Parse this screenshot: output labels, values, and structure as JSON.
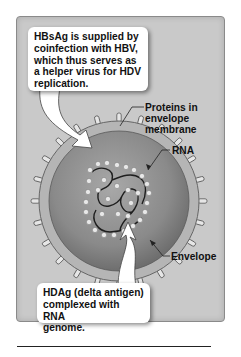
{
  "figure": {
    "callouts": {
      "top": {
        "lines": [
          "HBsAg is supplied by",
          "coinfection with HBV,",
          "which thus serves as",
          "a helper virus for HDV",
          "replication."
        ]
      },
      "bottom": {
        "lines": [
          "HDAg (delta antigen)",
          "complexed with RNA",
          "genome."
        ]
      }
    },
    "labels": {
      "proteins": [
        "Proteins in",
        "envelope",
        "membrane"
      ],
      "rna": "RNA",
      "envelope": "Envelope"
    },
    "colors": {
      "panel_bg": "#c9c9c9",
      "virion_core": "#8c8c8c",
      "envelope_ring": "#b5b5b5",
      "callout_bg": "#ffffff"
    }
  }
}
